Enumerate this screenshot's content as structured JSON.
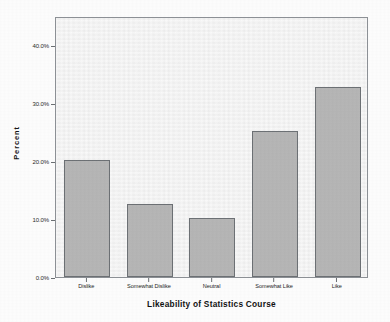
{
  "chart_data": {
    "type": "bar",
    "title": "",
    "subtitle": "",
    "xlabel": "Likeability of Statistics Course",
    "ylabel": "Percent",
    "categories": [
      "Dislike",
      "Somewhat Dislike",
      "Neutral",
      "Somewhat Like",
      "Like"
    ],
    "values": [
      20.2,
      12.6,
      10.1,
      25.2,
      32.7
    ],
    "ytick_labels": [
      "0.0%",
      "10.0%",
      "20.0%",
      "30.0%",
      "40.0%"
    ],
    "ytick_values": [
      0,
      10,
      20,
      30,
      40
    ],
    "ylim": [
      0,
      45
    ],
    "grid": false,
    "legend": false,
    "legend_position": "none",
    "bar_fill_color": "#b6b6b6",
    "bar_border_color": "#6d7175",
    "plot_background_color": "#f1f1f1",
    "axis_color": "#8d9196"
  },
  "figure": {
    "background_color": "#fdfdfd"
  }
}
